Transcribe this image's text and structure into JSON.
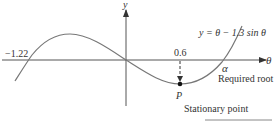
{
  "diagram": {
    "type": "function-sketch",
    "equation": "y = θ − 1.3 sin θ",
    "axes": {
      "x_label": "θ",
      "y_label": "y"
    },
    "annotations": {
      "left_root": "−1.22",
      "stationary_x": "0.6",
      "root_symbol": "α",
      "root_caption": "Required root",
      "point_label": "P",
      "point_caption": "Stationary point"
    },
    "key_points": [
      {
        "name": "left-root",
        "theta": -1.22,
        "y": 0
      },
      {
        "name": "origin",
        "theta": 0,
        "y": 0
      },
      {
        "name": "stationary-point-P",
        "theta": 0.6,
        "y": "min"
      },
      {
        "name": "alpha",
        "theta": "α",
        "y": 0
      }
    ],
    "colors": {
      "curve": "#777777",
      "axis": "#555555",
      "text": "#333333"
    }
  }
}
